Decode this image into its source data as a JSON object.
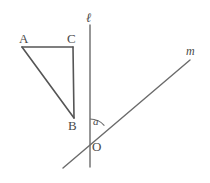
{
  "figure": {
    "type": "geometry-diagram",
    "background_color": "#ffffff",
    "stroke_color": "#555555",
    "label_color": "#4a4a4a",
    "points": [
      {
        "id": "A",
        "label": "A",
        "x": 22,
        "y": 47
      },
      {
        "id": "C",
        "label": "C",
        "x": 73,
        "y": 47
      },
      {
        "id": "B",
        "label": "B",
        "x": 74,
        "y": 118
      },
      {
        "id": "O",
        "label": "O",
        "x": 90,
        "y": 138
      }
    ],
    "segments": [
      {
        "id": "AC",
        "from": "A",
        "to": "C",
        "x1": 22,
        "y1": 47,
        "x2": 73,
        "y2": 47
      },
      {
        "id": "CB",
        "from": "C",
        "to": "B",
        "x1": 73,
        "y1": 47,
        "x2": 74,
        "y2": 118
      },
      {
        "id": "AB",
        "from": "A",
        "to": "B",
        "x1": 22,
        "y1": 47,
        "x2": 74,
        "y2": 118
      }
    ],
    "lines": [
      {
        "id": "l",
        "label": "ℓ",
        "x1": 90,
        "y1": 25,
        "x2": 90,
        "y2": 167
      },
      {
        "id": "m",
        "label": "m",
        "x1": 63,
        "y1": 168,
        "x2": 190,
        "y2": 60
      }
    ],
    "angle": {
      "id": "a",
      "label": "a",
      "vertex": "O",
      "center_x": 90,
      "center_y": 138,
      "radius": 19
    }
  }
}
